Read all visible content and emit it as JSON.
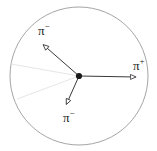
{
  "diagram": {
    "background_color": "#ffffff",
    "circle": {
      "name": "bounding-circle",
      "center_x": 79,
      "center_y": 76,
      "radius": 69,
      "stroke_color": "#9a9a9a",
      "stroke_width": 0.9,
      "fill": "none"
    },
    "vertex": {
      "name": "decay-vertex",
      "x": 79,
      "y": 76,
      "size": 3.2,
      "color": "#1a1a1a"
    },
    "vectors": [
      {
        "id": "pi-minus-upper",
        "label_symbol": "π",
        "label_charge": "−",
        "label_text": "π−",
        "from_x": 79,
        "from_y": 76,
        "to_x": 41,
        "to_y": 43,
        "color": "#3a3a3a",
        "stroke_width": 1.0,
        "arrowhead": "open-triangle"
      },
      {
        "id": "pi-plus-right",
        "label_symbol": "π",
        "label_charge": "+",
        "label_text": "π+",
        "from_x": 79,
        "from_y": 76,
        "to_x": 141,
        "to_y": 77,
        "color": "#3a3a3a",
        "stroke_width": 1.0,
        "arrowhead": "open-triangle"
      },
      {
        "id": "pi-minus-lower",
        "label_symbol": "π",
        "label_charge": "−",
        "label_text": "π−",
        "from_x": 79,
        "from_y": 76,
        "to_x": 64,
        "to_y": 110,
        "color": "#3a3a3a",
        "stroke_width": 1.0,
        "arrowhead": "open-triangle"
      }
    ],
    "construction_lines": [
      {
        "id": "guide-upper-left",
        "from_x": 79,
        "from_y": 76,
        "to_x": 11,
        "to_y": 64,
        "color": "#e2e2e2",
        "stroke_width": 0.9
      },
      {
        "id": "guide-lower-left",
        "from_x": 79,
        "from_y": 76,
        "to_x": 17,
        "to_y": 99,
        "color": "#e2e2e2",
        "stroke_width": 0.9
      }
    ],
    "labels": {
      "pi_minus_upper": {
        "symbol": "π",
        "charge": "−"
      },
      "pi_plus_right": {
        "symbol": "π",
        "charge": "+"
      },
      "pi_minus_lower": {
        "symbol": "π",
        "charge": "−"
      }
    }
  }
}
